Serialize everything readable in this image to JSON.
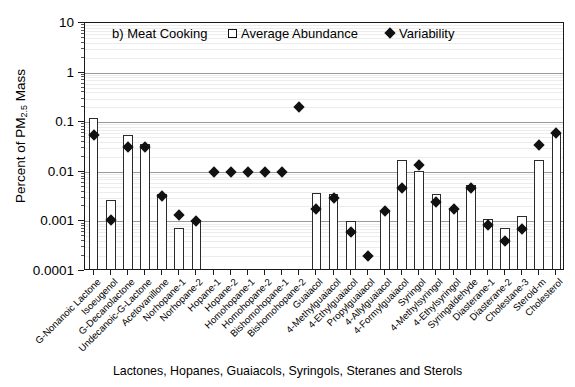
{
  "chart_data": {
    "type": "bar",
    "title": "b) Meat Cooking",
    "xlabel": "Lactones, Hopanes, Guaiacols, Syringols, Steranes and Sterols",
    "ylabel": "Percent of PM 2.5 Mass",
    "ylabel_main": "Percent of PM",
    "ylabel_sub": "2.5",
    "ylabel_tail": " Mass",
    "yscale": "log",
    "ylim": [
      0.0001,
      10
    ],
    "ytick_labels": [
      "10",
      "1",
      "0.1",
      "0.01",
      "0.001",
      "0.0001"
    ],
    "ytick_values": [
      10,
      1,
      0.1,
      0.01,
      0.001,
      0.0001
    ],
    "grid": "horizontal-log-minor",
    "legend_position": "top-center",
    "categories": [
      "G-Nonanoic Lactone",
      "Isoeugenol",
      "G-Decanolactone",
      "Undecanoic-G-Lactone",
      "Acetovanillone",
      "Norhopane-1",
      "Norhopane-2",
      "Hopane-1",
      "Hopane-2",
      "Homohopane-1",
      "Homohopane-2",
      "Bishomohopane-1",
      "Bishomohopane-2",
      "Guaiacol",
      "4-Methylguaiacol",
      "4-Ethylguaiacol",
      "Propylguaiacol",
      "4-Allylguaiacol",
      "4-Formylguaiacol",
      "Syringol",
      "4-Methylsyringol",
      "4-Ethylsyringol",
      "Syringaldehyde",
      "Diasterane-1",
      "Diasterane-2",
      "Cholestane-3",
      "Steroid-m",
      "Cholesterol"
    ],
    "series": [
      {
        "name": "Average Abundance",
        "marker": "open-square",
        "type": "bar",
        "values": [
          0.12,
          0.0027,
          0.054,
          0.037,
          0.0036,
          0.00072,
          0.00105,
          null,
          null,
          null,
          null,
          null,
          null,
          0.0037,
          0.0036,
          0.001,
          null,
          0.0016,
          0.017,
          0.0105,
          0.0035,
          0.0018,
          0.0055,
          0.0011,
          0.00075,
          0.0013,
          0.017,
          0.06
        ]
      },
      {
        "name": "Variability",
        "marker": "filled-diamond",
        "type": "scatter",
        "values": [
          0.055,
          0.00105,
          0.032,
          0.031,
          0.0032,
          0.00135,
          0.001,
          0.01,
          0.01,
          0.01,
          0.01,
          0.01,
          0.2,
          0.0018,
          0.0029,
          0.00062,
          0.0002,
          0.0016,
          0.0048,
          0.014,
          0.0025,
          0.0018,
          0.0048,
          0.00085,
          0.0004,
          0.0007,
          0.035,
          0.06
        ]
      }
    ]
  },
  "legend": {
    "items": [
      {
        "label": "Average Abundance",
        "marker": "open-square"
      },
      {
        "label": "Variability",
        "marker": "filled-diamond"
      }
    ]
  }
}
